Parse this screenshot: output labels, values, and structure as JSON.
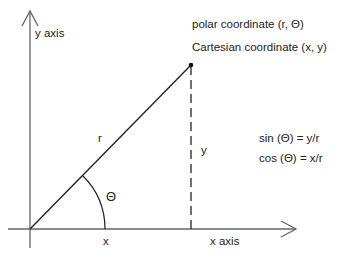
{
  "diagram": {
    "colors": {
      "line": "#222222",
      "axis": "#555555",
      "background": "#ffffff"
    },
    "labels": {
      "y_axis": "y axis",
      "x_axis": "x axis",
      "polar": "polar coordinate (r, Θ)",
      "cartesian": "Cartesian coordinate (x, y)",
      "r": "r",
      "theta": "Θ",
      "x": "x",
      "y": "y",
      "sin": "sin (Θ) = y/r",
      "cos": "cos (Θ) = x/r"
    },
    "geometry": {
      "origin": [
        30,
        229
      ],
      "point": [
        191,
        65
      ],
      "arc_radius": 75
    }
  }
}
